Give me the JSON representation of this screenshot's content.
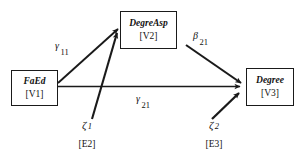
{
  "diagram": {
    "type": "structural-equation-path-diagram",
    "background_color": "#ffffff",
    "line_color": "#1a1a1a",
    "nodes": [
      {
        "id": "V1",
        "name": "FaEd",
        "code": "[V1]",
        "role": "exogenous-observed"
      },
      {
        "id": "V2",
        "name": "DegreAsp",
        "code": "[V2]",
        "role": "endogenous-mediator"
      },
      {
        "id": "V3",
        "name": "Degree",
        "code": "[V3]",
        "role": "endogenous-outcome"
      }
    ],
    "paths": [
      {
        "id": "gamma11",
        "symbol": "γ",
        "subscript": "11",
        "from": "V1",
        "to": "V2"
      },
      {
        "id": "gamma21",
        "symbol": "γ",
        "subscript": "21",
        "from": "V1",
        "to": "V3"
      },
      {
        "id": "beta21",
        "symbol": "β",
        "subscript": "21",
        "from": "V2",
        "to": "V3"
      }
    ],
    "disturbances": [
      {
        "id": "zeta1",
        "symbol": "ζ",
        "subscript": "1",
        "code": "[E2]",
        "to": "V2"
      },
      {
        "id": "zeta2",
        "symbol": "ζ",
        "subscript": "2",
        "code": "[E3]",
        "to": "V3"
      }
    ]
  }
}
